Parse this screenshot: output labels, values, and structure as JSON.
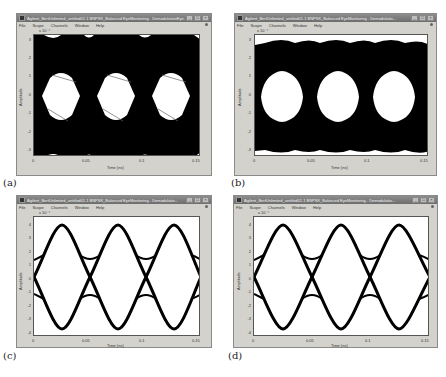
{
  "windows": [
    {
      "id": "a",
      "title": "Agilent_BertUnlimited_untitled01.1 BNPSK_Balanced EyeMonitoring - DemodulationEye...",
      "menu": [
        "File",
        "Scope",
        "Channels",
        "Window",
        "Help"
      ],
      "caption": "(a)",
      "exponent": "x 10⁻⁴",
      "yticks": [
        "3",
        "2",
        "1",
        "0",
        "-1",
        "-2",
        "-3"
      ],
      "xticks": [
        "0",
        "0.05",
        "0.1",
        "0.15"
      ],
      "xlabel": "Time (ns)",
      "ylabel": "Amplitude"
    },
    {
      "id": "b",
      "title": "Agilent_BertUnlimited_untitled01.1 BNPSK_Balanced EyeMonitoring - Demodulatio...",
      "menu": [
        "File",
        "Scope",
        "Channels",
        "Window",
        "Help"
      ],
      "caption": "(b)",
      "exponent": "x 10⁻⁴",
      "yticks": [
        "3",
        "2",
        "1",
        "0",
        "-1",
        "-2",
        "-3"
      ],
      "xticks": [
        "0",
        "0.05",
        "0.1",
        "0.15"
      ],
      "xlabel": "Time (ns)",
      "ylabel": "Amplitude"
    },
    {
      "id": "c",
      "title": "Agilent_BertUnlimited_untitled01.1 BNPSK_Balanced EyeMonitoring - Demodulatio...",
      "menu": [
        "File",
        "Scope",
        "Channels",
        "Window",
        "Help"
      ],
      "caption": "(c)",
      "exponent": "x 10⁻⁴",
      "yticks": [
        "4",
        "3",
        "2",
        "1",
        "0",
        "-1",
        "-2",
        "-3",
        "-4"
      ],
      "xticks": [
        "0",
        "0.05",
        "0.1",
        "0.15"
      ],
      "xlabel": "Time (ns)",
      "ylabel": "Amplitude"
    },
    {
      "id": "d",
      "title": "Agilent_BertUnlimited_untitled01.1 BNPSK_Balanced EyeMonitoring - Demodulatio...",
      "menu": [
        "File",
        "Scope",
        "Channels",
        "Window",
        "Help"
      ],
      "caption": "(d)",
      "exponent": "x 10⁻⁴",
      "yticks": [
        "4",
        "3",
        "2",
        "1",
        "0",
        "-1",
        "-2",
        "-3",
        "-4"
      ],
      "xticks": [
        "0",
        "0.05",
        "0.1",
        "0.15"
      ],
      "xlabel": "Time (ns)",
      "ylabel": "Amplitude"
    }
  ],
  "window_controls": {
    "minimize": "_",
    "maximize": "□",
    "close": "×"
  },
  "colors": {
    "trace": "#000000",
    "frame": "#d4d2cc",
    "titlebar": "#7a7a7a"
  }
}
